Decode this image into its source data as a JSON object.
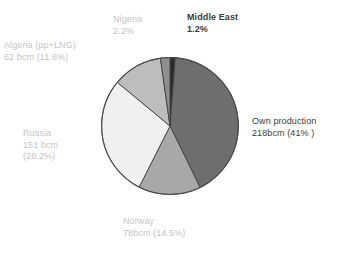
{
  "chart_data": {
    "type": "pie",
    "title": "",
    "unit": "bcm",
    "total_label": "",
    "legend": "labels-outside",
    "start_angle_deg": 0,
    "direction": "clockwise",
    "categories": [
      "Middle East",
      "Own production",
      "Norway",
      "Russia",
      "Algeria (pp+LNG)",
      "Nigeria"
    ],
    "values": [
      1.2,
      41.0,
      14.5,
      28.2,
      11.6,
      2.2
    ],
    "values_bcm": [
      null,
      218,
      78,
      151,
      62,
      null
    ],
    "colors": [
      "#2b2b2b",
      "#6e6e6e",
      "#a8a8a8",
      "#f0f0f0",
      "#bdbdbd",
      "#8f8f8f"
    ],
    "slices": [
      {
        "name": "Middle East",
        "percent": 1.2,
        "color": "#2b2b2b"
      },
      {
        "name": "Own production",
        "percent": 41.0,
        "bcm": 218,
        "color": "#6e6e6e"
      },
      {
        "name": "Norway",
        "percent": 14.5,
        "bcm": 78,
        "color": "#a8a8a8"
      },
      {
        "name": "Russia",
        "percent": 28.2,
        "bcm": 151,
        "color": "#f0f0f0"
      },
      {
        "name": "Algeria (pp+LNG)",
        "percent": 11.6,
        "bcm": 62,
        "color": "#bdbdbd"
      },
      {
        "name": "Nigeria",
        "percent": 2.2,
        "color": "#8f8f8f"
      }
    ]
  },
  "labels": {
    "algeria": {
      "line1": "Algeria (pp+LNG)",
      "line2": "62 bcm (11.6%)"
    },
    "nigeria": {
      "line1": "Nigeria",
      "line2": "2.2%"
    },
    "middle_east": {
      "line1": "Middle East",
      "line2": "1.2%"
    },
    "own_production": {
      "line1": "Own production",
      "line2": "218bcm (41% )"
    },
    "russia": {
      "line1": "Russia",
      "line2": "151 bcm",
      "line3": "(28.2%)"
    },
    "norway": {
      "line1": "Norway",
      "line2": "78bcm (14.5%)"
    }
  }
}
